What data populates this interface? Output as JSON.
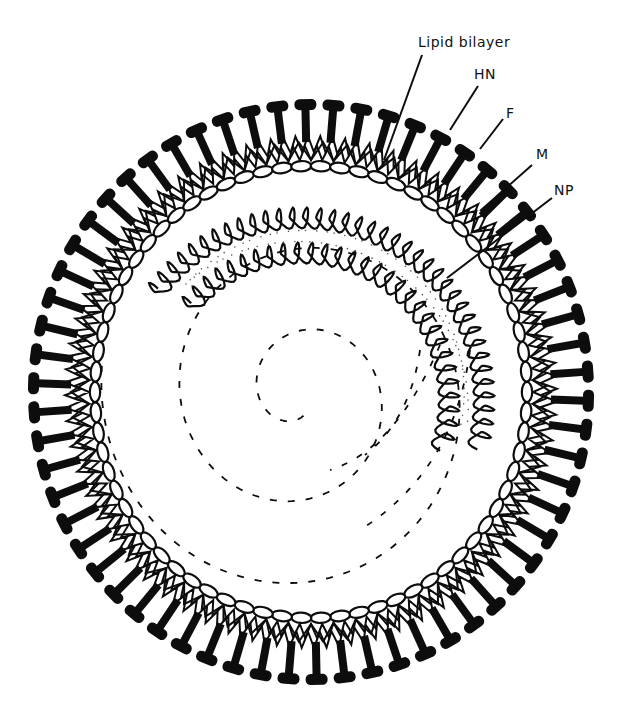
{
  "diagram": {
    "labels": [
      {
        "id": "lipid-bilayer",
        "text": "Lipid bilayer",
        "x": 418,
        "y": 34,
        "line": [
          422,
          55,
          384,
          160
        ]
      },
      {
        "id": "hn",
        "text": "HN",
        "x": 474,
        "y": 66,
        "line": [
          478,
          86,
          450,
          130
        ]
      },
      {
        "id": "f",
        "text": "F",
        "x": 506,
        "y": 105,
        "line": [
          503,
          119,
          480,
          149
        ]
      },
      {
        "id": "m",
        "text": "M",
        "x": 536,
        "y": 146,
        "line": [
          532,
          165,
          480,
          211
        ]
      },
      {
        "id": "np",
        "text": "NP",
        "x": 554,
        "y": 182,
        "line": [
          552,
          198,
          447,
          278
        ]
      }
    ],
    "envelope": {
      "cx": 311,
      "cy": 392,
      "inner_rx": 210,
      "inner_ry": 220,
      "spike_count": 62,
      "bead_count": 70,
      "zigzag_count": 124
    },
    "nucleocapsid": {
      "cx": 302,
      "cy": 400,
      "coils": [
        {
          "name": "outer",
          "r": 182,
          "start_deg": 216,
          "end_deg": 374,
          "count": 38
        },
        {
          "name": "inner",
          "r": 147,
          "start_deg": 219,
          "end_deg": 378,
          "count": 30
        }
      ]
    },
    "rna_spiral": {
      "cx": 300,
      "cy": 395,
      "start_r": 20,
      "end_r": 200,
      "turns": 2.3,
      "start_deg": 80
    },
    "colors": {
      "ink": "#0d0d0d",
      "background": "#ffffff"
    }
  }
}
